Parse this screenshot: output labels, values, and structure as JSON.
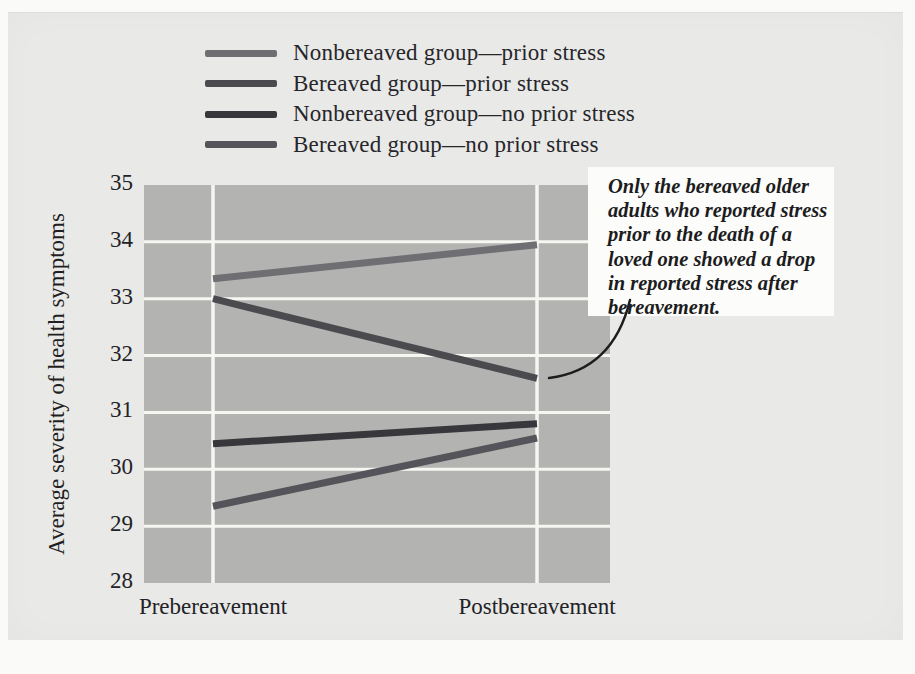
{
  "chart_data": {
    "type": "line",
    "title": "",
    "categories": [
      "Prebereavement",
      "Postbereavement"
    ],
    "xlabel": "",
    "ylabel": "Average severity of health symptoms",
    "ylim": [
      28,
      35
    ],
    "yticks": [
      35,
      34,
      33,
      32,
      31,
      30,
      29,
      28
    ],
    "grid": true,
    "legend_position": "top-left",
    "plot_bg": "#b3b3b1",
    "grid_color": "#f6f6f3",
    "series": [
      {
        "name": "Nonbereaved group—prior stress",
        "values": [
          33.35,
          33.95
        ],
        "color": "#6f6f73"
      },
      {
        "name": "Bereaved group—prior stress",
        "values": [
          33.0,
          31.6
        ],
        "color": "#4a4a4f"
      },
      {
        "name": "Nonbereaved group—no prior stress",
        "values": [
          30.45,
          30.8
        ],
        "color": "#38383c"
      },
      {
        "name": "Bereaved group—no prior stress",
        "values": [
          29.35,
          30.55
        ],
        "color": "#54545a"
      }
    ]
  },
  "annotation": {
    "lines": [
      "Only the bereaved older",
      "adults who reported stress",
      "prior to the death of a",
      "loved one showed a drop",
      "in reported stress after",
      "bereavement."
    ],
    "box_color": "#fcfcfa",
    "connector_color": "#1d1d1f"
  }
}
